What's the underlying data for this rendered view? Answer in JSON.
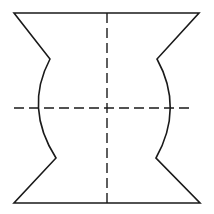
{
  "diagram": {
    "type": "technical-section-profile",
    "colors": {
      "stroke": "#1a1a1a",
      "background": "#ffffff"
    },
    "outline": {
      "top_left": [
        14,
        13
      ],
      "top_right": [
        199,
        13
      ],
      "right_upper_notch": [
        157,
        59
      ],
      "right_arc_extreme": [
        174,
        108
      ],
      "right_lower_notch": [
        156,
        158
      ],
      "bottom_right": [
        200,
        203
      ],
      "bottom_left": [
        14,
        203
      ],
      "left_lower_notch": [
        56,
        158
      ],
      "left_arc_extreme": [
        34,
        108
      ],
      "left_upper_notch": [
        50,
        59
      ]
    },
    "centerlines": {
      "vertical": {
        "x": 107,
        "y1": 13,
        "y2": 203
      },
      "horizontal": {
        "y": 108,
        "x1": 14,
        "x2": 194
      }
    }
  }
}
